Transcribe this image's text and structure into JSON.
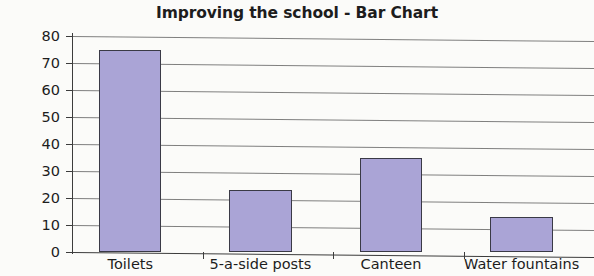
{
  "chart_data": {
    "type": "bar",
    "title": "Improving the school - Bar Chart",
    "xlabel": "",
    "ylabel": "",
    "categories": [
      "Toilets",
      "5-a-side posts",
      "Canteen",
      "Water fountains"
    ],
    "values": [
      75,
      23,
      35,
      13
    ],
    "ylim": [
      0,
      80
    ],
    "yticks": [
      0,
      10,
      20,
      30,
      40,
      50,
      60,
      70,
      80
    ],
    "ytick_labels": [
      "0",
      "10",
      "20",
      "30",
      "40",
      "50",
      "60",
      "70",
      "80"
    ],
    "grid": true,
    "legend": null,
    "bar_color": "#aaa4d6",
    "bar_edge_color": "#3a3a46",
    "axis_color": "#3c3c3c",
    "background_color": "#fbfbf9"
  }
}
